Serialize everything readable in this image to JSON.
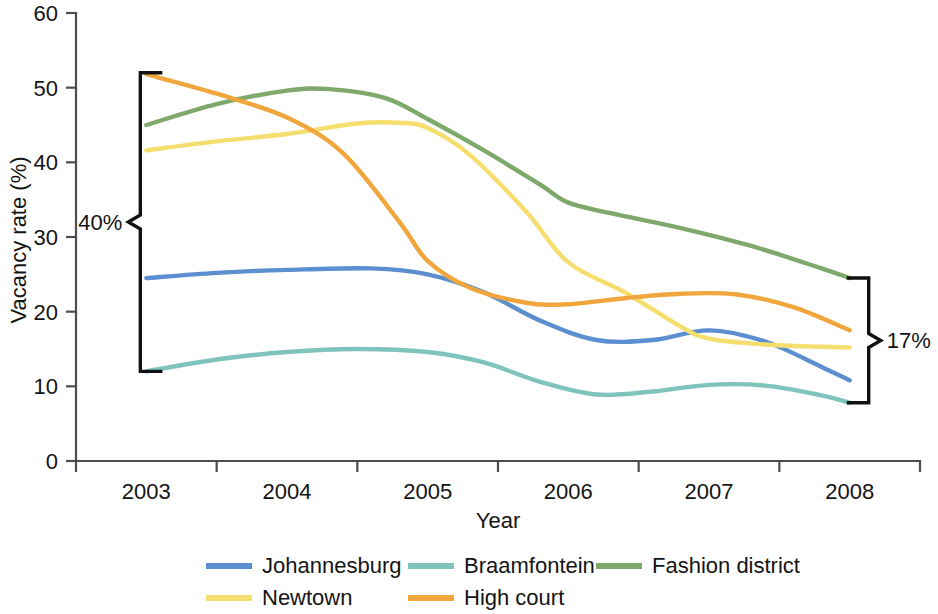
{
  "chart_data": {
    "type": "line",
    "title": "",
    "xlabel": "Year",
    "ylabel": "Vacancy rate (%)",
    "x": [
      2003,
      2004,
      2005,
      2006,
      2007,
      2008
    ],
    "xtick_labels": [
      "2003",
      "2004",
      "2005",
      "2006",
      "2007",
      "2008"
    ],
    "ytick_labels": [
      "0",
      "10",
      "20",
      "30",
      "40",
      "50",
      "60"
    ],
    "ytick_values": [
      0,
      10,
      20,
      30,
      40,
      50,
      60
    ],
    "xlim": [
      2002.6,
      2008.6
    ],
    "ylim": [
      0,
      60
    ],
    "grid": false,
    "legend_position": "bottom",
    "series": [
      {
        "name": "Johannesburg",
        "color": "#5B8FD0",
        "values": [
          24.5,
          25.5,
          25.3,
          16.2,
          17.5,
          10.8
        ],
        "detail_x": [
          2003.0,
          2003.5,
          2004.0,
          2004.6,
          2005.0,
          2005.4,
          2005.8,
          2006.2,
          2006.6,
          2007.0,
          2007.4,
          2007.8,
          2008.0
        ],
        "detail_y": [
          24.5,
          25.2,
          25.6,
          25.8,
          25.0,
          22.6,
          18.8,
          16.2,
          16.2,
          17.5,
          16.0,
          12.6,
          10.8
        ]
      },
      {
        "name": "Braamfontein",
        "color": "#7FC4BC",
        "values": [
          12.0,
          14.6,
          15.0,
          8.9,
          10.2,
          7.8
        ],
        "detail_x": [
          2003.0,
          2003.5,
          2004.0,
          2004.5,
          2005.0,
          2005.4,
          2005.8,
          2006.2,
          2006.6,
          2007.0,
          2007.4,
          2007.8,
          2008.0
        ],
        "detail_y": [
          12.0,
          13.6,
          14.6,
          15.0,
          14.6,
          13.2,
          10.6,
          8.9,
          9.3,
          10.2,
          10.1,
          8.8,
          7.8
        ]
      },
      {
        "name": "Fashion district",
        "color": "#7FA86B",
        "values": [
          45.0,
          49.8,
          45.5,
          34.6,
          29.8,
          24.5
        ],
        "detail_x": [
          2003.0,
          2003.5,
          2004.0,
          2004.3,
          2004.7,
          2005.0,
          2005.4,
          2005.8,
          2006.0,
          2006.3,
          2006.8,
          2007.3,
          2007.8,
          2008.0
        ],
        "detail_y": [
          45.0,
          47.8,
          49.6,
          49.8,
          48.6,
          45.8,
          41.6,
          37.0,
          34.6,
          33.2,
          31.2,
          28.8,
          25.8,
          24.5
        ]
      },
      {
        "name": "Newtown",
        "color": "#F5DE6E",
        "values": [
          41.6,
          43.8,
          45.2,
          26.6,
          16.0,
          15.2
        ],
        "detail_x": [
          2003.0,
          2003.5,
          2004.0,
          2004.5,
          2004.8,
          2005.0,
          2005.3,
          2005.7,
          2006.0,
          2006.4,
          2006.8,
          2007.0,
          2007.4,
          2007.8,
          2008.0
        ],
        "detail_y": [
          41.6,
          42.8,
          43.8,
          45.2,
          45.3,
          44.6,
          41.0,
          33.4,
          26.6,
          22.6,
          18.0,
          16.4,
          15.6,
          15.3,
          15.2
        ]
      },
      {
        "name": "High court",
        "color": "#F0A63C",
        "values": [
          51.8,
          46.0,
          26.8,
          21.6,
          22.4,
          17.5
        ],
        "detail_x": [
          2003.0,
          2003.5,
          2004.0,
          2004.4,
          2004.8,
          2005.0,
          2005.3,
          2005.7,
          2006.0,
          2006.4,
          2006.8,
          2007.2,
          2007.6,
          2008.0
        ],
        "detail_y": [
          51.8,
          49.2,
          46.0,
          41.2,
          32.0,
          26.8,
          23.2,
          21.2,
          21.0,
          21.8,
          22.4,
          22.3,
          20.6,
          17.5
        ]
      }
    ],
    "annotations": [
      {
        "id": "left-bracket",
        "label": "40%",
        "at_x": 2003.0,
        "y_top": 52.0,
        "y_bottom": 12.0,
        "range": 40
      },
      {
        "id": "right-bracket",
        "label": "17%",
        "at_x": 2008.05,
        "y_top": 24.5,
        "y_bottom": 7.8,
        "range": 17
      }
    ]
  },
  "legend": {
    "items": [
      {
        "label": "Johannesburg",
        "color": "#5B8FD0"
      },
      {
        "label": "Braamfontein",
        "color": "#7FC4BC"
      },
      {
        "label": "Fashion district",
        "color": "#7FA86B"
      },
      {
        "label": "Newtown",
        "color": "#F5DE6E"
      },
      {
        "label": "High court",
        "color": "#F0A63C"
      }
    ]
  },
  "axes": {
    "y_title": "Vacancy rate (%)",
    "x_title": "Year"
  }
}
